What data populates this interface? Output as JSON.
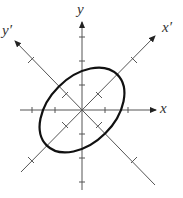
{
  "diagram": {
    "type": "rotated-axes-ellipse",
    "labels": {
      "x": "x",
      "y": "y",
      "x_prime": "x′",
      "y_prime": "y′"
    },
    "rotation_deg": 45,
    "ellipse": {
      "semi_major": 2,
      "semi_minor": 1.3,
      "major_axis": "x′"
    },
    "tick_spacing": 1,
    "colors": {
      "axis": "#555555",
      "ellipse": "#111111"
    }
  }
}
